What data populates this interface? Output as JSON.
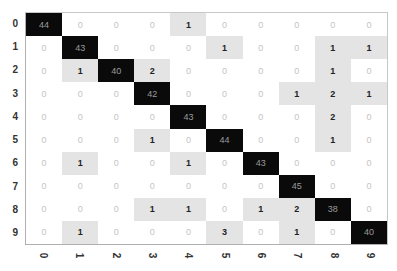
{
  "chart_data": {
    "type": "heatmap",
    "title": "",
    "xlabel": "",
    "ylabel": "",
    "x_ticks": [
      "0",
      "1",
      "2",
      "3",
      "4",
      "5",
      "6",
      "7",
      "8",
      "9"
    ],
    "y_ticks": [
      "0",
      "1",
      "2",
      "3",
      "4",
      "5",
      "6",
      "7",
      "8",
      "9"
    ],
    "matrix": [
      [
        44,
        0,
        0,
        0,
        1,
        0,
        0,
        0,
        0,
        0
      ],
      [
        0,
        43,
        0,
        0,
        0,
        1,
        0,
        0,
        1,
        1
      ],
      [
        0,
        1,
        40,
        2,
        0,
        0,
        0,
        0,
        1,
        0
      ],
      [
        0,
        0,
        0,
        42,
        0,
        0,
        0,
        1,
        2,
        1
      ],
      [
        0,
        0,
        0,
        0,
        43,
        0,
        0,
        0,
        2,
        0
      ],
      [
        0,
        0,
        0,
        1,
        0,
        44,
        0,
        0,
        1,
        0
      ],
      [
        0,
        1,
        0,
        0,
        1,
        0,
        43,
        0,
        0,
        0
      ],
      [
        0,
        0,
        0,
        0,
        0,
        0,
        0,
        45,
        0,
        0
      ],
      [
        0,
        0,
        0,
        1,
        1,
        0,
        1,
        2,
        38,
        0
      ],
      [
        0,
        1,
        0,
        0,
        0,
        3,
        0,
        1,
        0,
        40
      ]
    ],
    "colormap": "greys",
    "value_labels": true,
    "grid": false,
    "legend": "none"
  },
  "colors": {
    "high": "#0a0a0a",
    "low": "#e4e4e4",
    "zero": "#ffffff"
  }
}
